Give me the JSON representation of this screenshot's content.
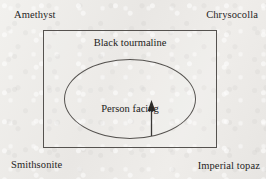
{
  "figure": {
    "background_color": "#ecebe8",
    "stroke_color": "#55524f",
    "text_color": "#262524"
  },
  "corner_labels": {
    "top_left": "Amethyst",
    "top_right": "Chrysocolla",
    "bottom_left": "Smithsonite",
    "bottom_right": "Imperial topaz"
  },
  "room": {
    "label": "Black tourmaline"
  },
  "table": {
    "label": "Person facing",
    "arrow_direction": "up",
    "arrow_icon": "arrow-up-icon"
  }
}
